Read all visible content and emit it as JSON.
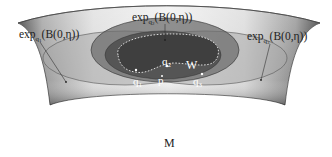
{
  "labels": {
    "exp_q1": {
      "base": "exp",
      "sub": "q",
      "subsub": "1",
      "arg": "(B(0,η))"
    },
    "exp_q2": {
      "base": "exp",
      "sub": "q",
      "subsub": "2",
      "arg": "(B(0,η))"
    },
    "exp_q3": {
      "base": "exp",
      "sub": "q",
      "subsub": "3",
      "arg": "(B(0,η))"
    },
    "manifold": "M",
    "region": "W",
    "points": {
      "q1": {
        "base": "q",
        "sub": "1"
      },
      "q2": {
        "base": "q",
        "sub": "2"
      },
      "q3": {
        "base": "q",
        "sub": "3"
      },
      "p": "p"
    }
  },
  "colors": {
    "surface_light": "#e8e8e8",
    "surface_dark": "#3a3a3a",
    "ellipse_outer": "#b8b8b8",
    "ellipse_mid": "#8a8a8a",
    "ellipse_inner": "#5e5e5e",
    "region_w": "#454545"
  }
}
